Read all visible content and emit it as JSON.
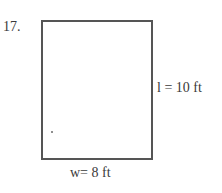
{
  "problem": {
    "number": "17."
  },
  "figure": {
    "shape": "rectangle",
    "length_label": "l = 10 ft",
    "width_label": "w= 8 ft",
    "stroke_color": "#555555"
  }
}
